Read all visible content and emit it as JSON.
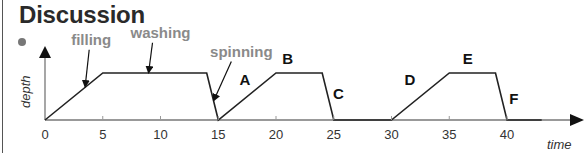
{
  "title": "Discussion",
  "chart_data": {
    "type": "line",
    "title": "",
    "xlabel": "time",
    "ylabel": "depth",
    "xlim": [
      0,
      44
    ],
    "x_ticks": [
      0,
      5,
      10,
      15,
      20,
      25,
      30,
      35,
      40
    ],
    "x_tick_labels": [
      "0",
      "5",
      "10",
      "15",
      "20",
      "25",
      "30",
      "35",
      "40"
    ],
    "series": [
      {
        "name": "depth",
        "points": [
          [
            0,
            0
          ],
          [
            5,
            1
          ],
          [
            14,
            1
          ],
          [
            15,
            0
          ],
          [
            20,
            1
          ],
          [
            24,
            1
          ],
          [
            25,
            0
          ],
          [
            30,
            0
          ],
          [
            35,
            1
          ],
          [
            39,
            1
          ],
          [
            40,
            0
          ],
          [
            43,
            0
          ]
        ]
      }
    ],
    "annotations": [
      {
        "text": "filling",
        "style": "gray",
        "target": [
          3.5,
          0.7
        ],
        "label_at": [
          4,
          1.6
        ]
      },
      {
        "text": "washing",
        "style": "gray",
        "target": [
          9,
          1
        ],
        "label_at": [
          10,
          1.75
        ]
      },
      {
        "text": "spinning",
        "style": "gray",
        "target": [
          14.7,
          0.4
        ],
        "label_at": [
          17,
          1.35
        ]
      },
      {
        "text": "A",
        "style": "bold",
        "label_at": [
          17.3,
          0.75
        ]
      },
      {
        "text": "B",
        "style": "bold",
        "label_at": [
          21,
          1.2
        ]
      },
      {
        "text": "C",
        "style": "bold",
        "label_at": [
          25.4,
          0.45
        ]
      },
      {
        "text": "D",
        "style": "bold",
        "label_at": [
          31.6,
          0.75
        ]
      },
      {
        "text": "E",
        "style": "bold",
        "label_at": [
          36.6,
          1.2
        ]
      },
      {
        "text": "F",
        "style": "bold",
        "label_at": [
          40.6,
          0.35
        ]
      }
    ]
  }
}
